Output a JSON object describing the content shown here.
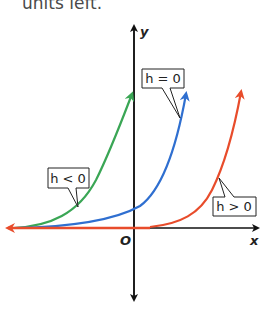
{
  "header": {
    "text": "units left."
  },
  "axes": {
    "x_label": "x",
    "y_label": "y",
    "origin_label": "O"
  },
  "curves": [
    {
      "name": "h < 0",
      "label": "h < 0",
      "color": "#3aa655"
    },
    {
      "name": "h = 0",
      "label": "h = 0",
      "color": "#2f6fd0"
    },
    {
      "name": "h > 0",
      "label": "h > 0",
      "color": "#e84c2b"
    }
  ],
  "labels": {
    "h_neg": "h < 0",
    "h_zero": "h = 0",
    "h_pos": "h > 0"
  }
}
